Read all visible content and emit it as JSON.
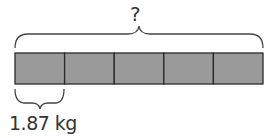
{
  "diagram": {
    "type": "tape-diagram",
    "total_label": "?",
    "unit_label": "1.87 kg",
    "segment_count": 5,
    "segment_color": "#9a9a9a",
    "border_color": "#2a2a2a"
  }
}
